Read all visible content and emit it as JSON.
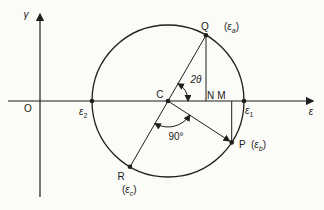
{
  "labels": {
    "gamma_axis": "γ",
    "epsilon_axis": "ε",
    "origin": "O",
    "center": "C",
    "point_n": "N",
    "point_m": "M",
    "point_q": "Q",
    "point_p": "P",
    "point_r": "R",
    "angle_2theta": "2θ",
    "angle_90": "90°",
    "eps_1": {
      "base": "ε",
      "sub": "1"
    },
    "eps_2": {
      "base": "ε",
      "sub": "2"
    },
    "eps_a": {
      "open": "(",
      "base": "ε",
      "sub": "a",
      "close": ")"
    },
    "eps_b": {
      "open": "(",
      "base": "ε",
      "sub": "b",
      "close": ")"
    },
    "eps_c": {
      "open": "(",
      "base": "ε",
      "sub": "c",
      "close": ")"
    }
  },
  "colors": {
    "ink": "#1f1f1f",
    "background": "#fbfbf8"
  }
}
